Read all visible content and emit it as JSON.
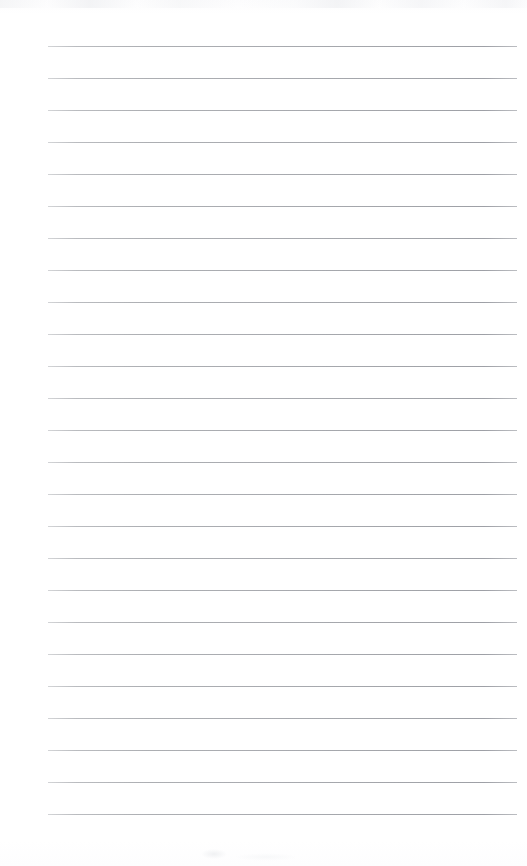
{
  "document": {
    "kind": "scanned-lined-notebook-page",
    "title": "Blank Ruled Notebook Page",
    "page_width": 527,
    "page_height": 866,
    "background_color": "#ffffff",
    "has_text_content": false,
    "written_content": "",
    "handwriting_present": false,
    "printed_text_present": false
  },
  "ruling": {
    "line_color": "#a8aaae",
    "line_thickness_px": 1,
    "line_count": 25,
    "line_spacing_px": 32,
    "first_line_y": 46,
    "last_line_y": 814,
    "line_start_x": 48,
    "line_end_x": 517,
    "line_length_px": 469,
    "left_margin_px": 48,
    "right_margin_px": 10,
    "top_margin_px": 46,
    "bottom_margin_px": 52,
    "vertical_margin_rule_present": false,
    "line_y_positions": [
      46,
      78,
      110,
      142,
      174,
      206,
      238,
      270,
      302,
      334,
      366,
      398,
      430,
      462,
      494,
      526,
      558,
      590,
      622,
      654,
      686,
      718,
      750,
      782,
      814
    ]
  },
  "artifacts": {
    "top_scan_band_color": "#eef0f2",
    "top_scan_band_height_px": 8,
    "bottom_smudge_color": "#e6e8eb",
    "bottom_smudge_x": 196,
    "bottom_smudge_y": 846
  }
}
